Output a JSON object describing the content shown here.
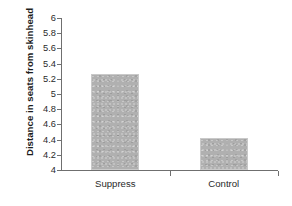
{
  "chart_data": {
    "type": "bar",
    "title": "",
    "xlabel": "",
    "ylabel": "Distance in seats from skinhead",
    "categories": [
      "Suppress",
      "Control"
    ],
    "values": [
      5.26,
      4.42
    ],
    "ylim": [
      4,
      6
    ],
    "yticks": [
      "6",
      "5.8",
      "5.6",
      "5.4",
      "5.2",
      "5",
      "4.8",
      "4.6",
      "4.4",
      "4.2",
      "4"
    ],
    "ytick_values": [
      6,
      5.8,
      5.6,
      5.4,
      5.2,
      5,
      4.8,
      4.6,
      4.4,
      4.2,
      4
    ],
    "grid": false,
    "legend": null,
    "bar_color": "#b0b0b0",
    "axis_color": "#6f6f6f",
    "background": "#ffffff"
  }
}
